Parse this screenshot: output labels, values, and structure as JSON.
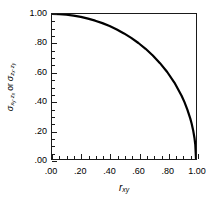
{
  "chart_data": {
    "type": "line",
    "title": "",
    "subtitle": "",
    "xlabel": "r_xy",
    "xlabel_parts": {
      "base": "r",
      "sub": "xy"
    },
    "ylabel": "σ(x_y·z_x) or σ(z_x·z_y)",
    "ylabel_parts": {
      "sigma": "σ",
      "sub1_base": "x",
      "sub1_sub": "y",
      "sub1_dot": "·",
      "sub1_base2": "z",
      "sub1_sub2": "x",
      "or": "or",
      "sub2_base": "z",
      "sub2_sub": "x",
      "sub2_dot": "·",
      "sub2_base2": "z",
      "sub2_sub2": "y"
    },
    "xlim": [
      0.0,
      1.0
    ],
    "ylim": [
      0.0,
      1.0
    ],
    "grid": false,
    "legend": "none",
    "xticks": [
      0.0,
      0.2,
      0.4,
      0.6,
      0.8,
      1.0
    ],
    "xticklabels": [
      ".00",
      ".20",
      ".40",
      ".60",
      ".80",
      "1.00"
    ],
    "yticks": [
      0.0,
      0.2,
      0.4,
      0.6,
      0.8,
      1.0
    ],
    "yticklabels": [
      ".00",
      ".20",
      ".40",
      ".60",
      ".80",
      "1.00"
    ],
    "minor_tick_step": 0.05,
    "series": [
      {
        "name": "standard error curve",
        "equation": "y = sqrt(1 - x^2)",
        "color": "#000000",
        "linewidth": 2,
        "x": [
          0.0,
          0.05,
          0.1,
          0.15,
          0.2,
          0.25,
          0.3,
          0.35,
          0.4,
          0.45,
          0.5,
          0.55,
          0.6,
          0.65,
          0.7,
          0.75,
          0.8,
          0.85,
          0.9,
          0.92,
          0.94,
          0.96,
          0.97,
          0.98,
          0.99,
          0.995,
          1.0
        ],
        "y": [
          1.0,
          0.999,
          0.995,
          0.989,
          0.98,
          0.968,
          0.954,
          0.937,
          0.917,
          0.893,
          0.866,
          0.835,
          0.8,
          0.76,
          0.714,
          0.661,
          0.6,
          0.527,
          0.436,
          0.392,
          0.341,
          0.28,
          0.243,
          0.199,
          0.141,
          0.1,
          0.0
        ]
      }
    ]
  },
  "colors": {
    "axis": "#1a1a1a",
    "curve": "#000000",
    "background": "#ffffff",
    "text": "#000000"
  }
}
